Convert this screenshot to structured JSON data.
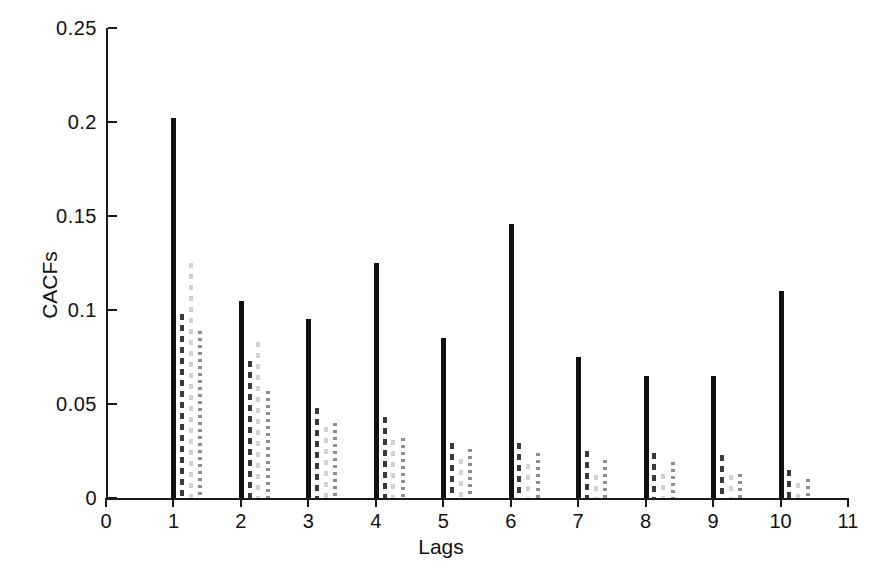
{
  "chart_data": {
    "type": "bar",
    "title": "",
    "xlabel": "Lags",
    "ylabel": "CACFs",
    "xlim": [
      0,
      11
    ],
    "ylim": [
      0,
      0.25
    ],
    "grid": false,
    "legend": "none",
    "x_ticks": [
      "0",
      "1",
      "2",
      "3",
      "4",
      "5",
      "6",
      "7",
      "8",
      "9",
      "10",
      "11"
    ],
    "x_tick_values": [
      0,
      1,
      2,
      3,
      4,
      5,
      6,
      7,
      8,
      9,
      10,
      11
    ],
    "y_ticks": [
      "0",
      "0.05",
      "0.1",
      "0.15",
      "0.2",
      "0.25"
    ],
    "y_tick_values": [
      0,
      0.05,
      0.1,
      0.15,
      0.2,
      0.25
    ],
    "categories": [
      1,
      2,
      3,
      4,
      5,
      6,
      7,
      8,
      9,
      10
    ],
    "series": [
      {
        "name": "solid",
        "style": "solid",
        "color": "#111111",
        "offset": 0.0,
        "values": [
          0.202,
          0.105,
          0.095,
          0.125,
          0.085,
          0.146,
          0.075,
          0.065,
          0.065,
          0.11
        ]
      },
      {
        "name": "dashed",
        "style": "dashed",
        "color": "#3a3a3a",
        "offset": 0.13,
        "values": [
          0.098,
          0.073,
          0.048,
          0.043,
          0.029,
          0.029,
          0.025,
          0.024,
          0.023,
          0.015
        ]
      },
      {
        "name": "faint",
        "style": "faint-dashed",
        "color": "#d2d2d2",
        "offset": 0.26,
        "values": [
          0.125,
          0.083,
          0.038,
          0.031,
          0.021,
          0.018,
          0.012,
          0.013,
          0.012,
          0.008
        ]
      },
      {
        "name": "dotted",
        "style": "dotted",
        "color": "#8e8e8e",
        "offset": 0.4,
        "values": [
          0.089,
          0.057,
          0.04,
          0.032,
          0.026,
          0.024,
          0.02,
          0.019,
          0.013,
          0.01
        ]
      }
    ]
  }
}
